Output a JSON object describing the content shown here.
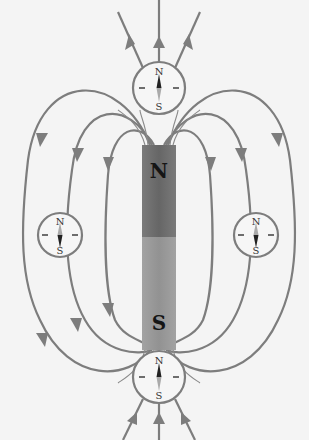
{
  "diagram": {
    "magnet": {
      "north_label": "N",
      "south_label": "S",
      "north_color": "#6e6e6e",
      "south_color": "#9a9a9a"
    },
    "compasses": [
      {
        "position": "top",
        "north_label": "N",
        "south_label": "S"
      },
      {
        "position": "left",
        "north_label": "N",
        "south_label": "S"
      },
      {
        "position": "right",
        "north_label": "N",
        "south_label": "S"
      },
      {
        "position": "bottom",
        "north_label": "N",
        "south_label": "S"
      }
    ],
    "field_line_color": "#7d7d7d",
    "field_direction": "out of N (top), into S (bottom)"
  }
}
